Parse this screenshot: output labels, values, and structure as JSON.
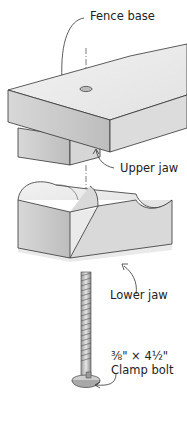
{
  "diagram": {
    "labels": {
      "fence_base": "Fence base",
      "upper_jaw": "Upper jaw",
      "lower_jaw": "Lower jaw",
      "bolt_size": "⅜\" × 4½\"",
      "clamp_bolt": "Clamp bolt"
    },
    "parts": [
      "fence-base",
      "upper-jaw",
      "lower-jaw",
      "clamp-bolt"
    ],
    "colors": {
      "wood_top": "#ededed",
      "wood_front": "#cfcfcf",
      "wood_side": "#e0e0e0",
      "outline": "#333333",
      "text": "#222222"
    }
  }
}
